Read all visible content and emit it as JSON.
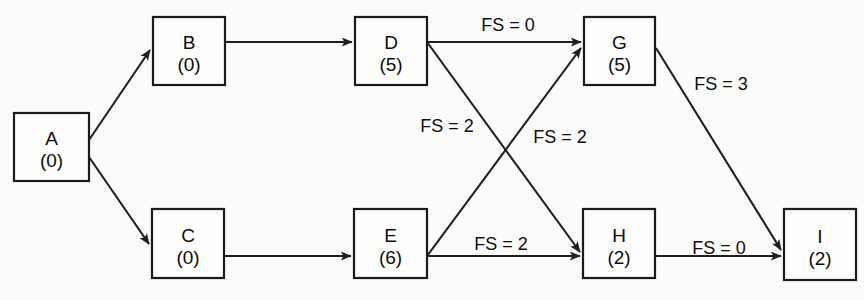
{
  "diagram": {
    "type": "precedence-network-diagram",
    "background_color": "#fbfbf9",
    "line_color": "#1f1f1f",
    "nodes": [
      {
        "id": "A",
        "label": "A",
        "duration": "(0)",
        "x": 14,
        "y": 113,
        "w": 75,
        "h": 68
      },
      {
        "id": "B",
        "label": "B",
        "duration": "(0)",
        "x": 153,
        "y": 17,
        "w": 72,
        "h": 68
      },
      {
        "id": "C",
        "label": "C",
        "duration": "(0)",
        "x": 152,
        "y": 209,
        "w": 72,
        "h": 69
      },
      {
        "id": "D",
        "label": "D",
        "duration": "(5)",
        "x": 355,
        "y": 17,
        "w": 72,
        "h": 68
      },
      {
        "id": "E",
        "label": "E",
        "duration": "(6)",
        "x": 354,
        "y": 209,
        "w": 73,
        "h": 69
      },
      {
        "id": "G",
        "label": "G",
        "duration": "(5)",
        "x": 584,
        "y": 17,
        "w": 71,
        "h": 68
      },
      {
        "id": "H",
        "label": "H",
        "duration": "(2)",
        "x": 583,
        "y": 209,
        "w": 72,
        "h": 69
      },
      {
        "id": "I",
        "label": "I",
        "duration": "(2)",
        "x": 784,
        "y": 209,
        "w": 72,
        "h": 71
      }
    ],
    "edges": [
      {
        "from": "A",
        "to": "B",
        "label": "",
        "x1": 89,
        "y1": 140,
        "x2": 150,
        "y2": 50
      },
      {
        "from": "A",
        "to": "C",
        "label": "",
        "x1": 89,
        "y1": 157,
        "x2": 149,
        "y2": 244
      },
      {
        "from": "B",
        "to": "D",
        "label": "",
        "x1": 225,
        "y1": 42,
        "x2": 352,
        "y2": 42
      },
      {
        "from": "C",
        "to": "E",
        "label": "",
        "x1": 225,
        "y1": 256,
        "x2": 351,
        "y2": 256
      },
      {
        "from": "D",
        "to": "G",
        "label": "FS = 0",
        "x1": 427,
        "y1": 42,
        "x2": 581,
        "y2": 42
      },
      {
        "from": "D",
        "to": "H",
        "label": "FS = 2",
        "x1": 427,
        "y1": 42,
        "x2": 580,
        "y2": 252
      },
      {
        "from": "E",
        "to": "G",
        "label": "FS = 2",
        "x1": 427,
        "y1": 256,
        "x2": 581,
        "y2": 48
      },
      {
        "from": "E",
        "to": "H",
        "label": "FS = 2",
        "x1": 427,
        "y1": 256,
        "x2": 580,
        "y2": 256
      },
      {
        "from": "G",
        "to": "I",
        "label": "FS = 3",
        "x1": 656,
        "y1": 48,
        "x2": 781,
        "y2": 250
      },
      {
        "from": "H",
        "to": "I",
        "label": "FS = 0",
        "x1": 656,
        "y1": 256,
        "x2": 781,
        "y2": 256
      }
    ],
    "edge_labels": [
      {
        "text": "FS = 0",
        "x": 508,
        "y": 31,
        "name": "edge-label-d-g"
      },
      {
        "text": "FS = 2",
        "x": 447,
        "y": 132,
        "name": "edge-label-d-h"
      },
      {
        "text": "FS = 2",
        "x": 560,
        "y": 143,
        "name": "edge-label-e-g"
      },
      {
        "text": "FS = 3",
        "x": 721,
        "y": 90,
        "name": "edge-label-g-i"
      },
      {
        "text": "FS = 2",
        "x": 501,
        "y": 250,
        "name": "edge-label-e-h"
      },
      {
        "text": "FS = 0",
        "x": 719,
        "y": 254,
        "name": "edge-label-h-i"
      }
    ]
  }
}
